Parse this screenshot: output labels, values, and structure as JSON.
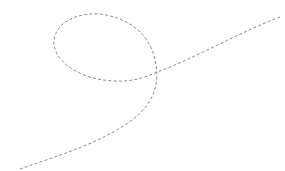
{
  "figure": {
    "stroke_color": "#8a8a8a",
    "background_color": "#ffffff",
    "line_style": "dashed"
  }
}
